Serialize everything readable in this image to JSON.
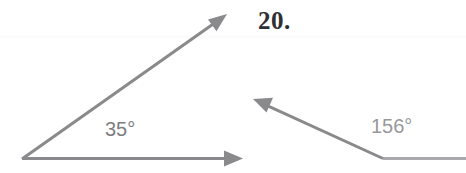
{
  "page": {
    "background_color": "#ffffff",
    "width": 466,
    "height": 173
  },
  "problem": {
    "number_label": "20."
  },
  "figures": [
    {
      "id": "left-angle",
      "name": "acute-angle-figure",
      "measure_label": "35°",
      "measure_value": 35,
      "measure_unit": "degrees",
      "vertex": {
        "x": 22,
        "y": 159
      },
      "rays": [
        {
          "name": "horizontal-ray",
          "from": {
            "x": 22,
            "y": 159
          },
          "to": {
            "x": 243,
            "y": 158
          },
          "arrowhead": "end"
        },
        {
          "name": "upper-ray",
          "from": {
            "x": 22,
            "y": 159
          },
          "to": {
            "x": 227,
            "y": 14
          },
          "arrowhead": "end"
        }
      ]
    },
    {
      "id": "right-angle",
      "name": "obtuse-angle-figure",
      "measure_label": "156°",
      "measure_value": 156,
      "measure_unit": "degrees",
      "vertex": {
        "x": 383,
        "y": 159
      },
      "rays": [
        {
          "name": "horizontal-ray",
          "from": {
            "x": 383,
            "y": 159
          },
          "to": {
            "x": 466,
            "y": 159
          },
          "arrowhead": "none"
        },
        {
          "name": "slanted-ray",
          "from": {
            "x": 383,
            "y": 159
          },
          "to": {
            "x": 253,
            "y": 100
          },
          "arrowhead": "end"
        }
      ]
    }
  ],
  "style": {
    "stroke_color": "#8a8a8d",
    "stroke_color_light": "#a9a9ac",
    "stroke_width": 3,
    "label_color_left": "#7d7d80",
    "label_color_right": "#98989b",
    "number_color": "#2f2f33",
    "faint_rule_color": "#fafafb"
  },
  "labels": {
    "text_35": "35",
    "text_156": "156",
    "degree_symbol": "°"
  }
}
